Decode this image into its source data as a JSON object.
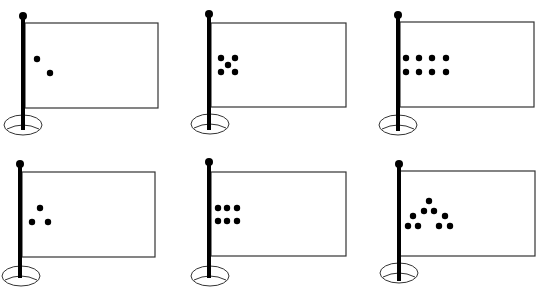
{
  "figure": {
    "colors": {
      "ink": "#000000",
      "outline": "#333333",
      "background": "#ffffff"
    },
    "flags": [
      {
        "id": "flag-1",
        "dot_count": 2,
        "pole": {
          "x": 23,
          "top": 16,
          "bottom": 130
        },
        "rect": {
          "x": 25,
          "y": 23,
          "w": 133,
          "h": 85
        },
        "base": {
          "cx": 23,
          "cy": 125,
          "rx": 19,
          "ry": 10
        },
        "dots": [
          [
            37,
            59
          ],
          [
            50,
            73
          ]
        ]
      },
      {
        "id": "flag-2",
        "dot_count": 5,
        "pole": {
          "x": 209,
          "top": 14,
          "bottom": 130
        },
        "rect": {
          "x": 211,
          "y": 23,
          "w": 135,
          "h": 84
        },
        "base": {
          "cx": 210,
          "cy": 124,
          "rx": 19,
          "ry": 10
        },
        "dots": [
          [
            221,
            58
          ],
          [
            235,
            58
          ],
          [
            228,
            65
          ],
          [
            221,
            72
          ],
          [
            235,
            72
          ]
        ]
      },
      {
        "id": "flag-3",
        "dot_count": 8,
        "pole": {
          "x": 398,
          "top": 15,
          "bottom": 131
        },
        "rect": {
          "x": 400,
          "y": 22,
          "w": 134,
          "h": 85
        },
        "base": {
          "cx": 398,
          "cy": 125,
          "rx": 19,
          "ry": 10
        },
        "dots": [
          [
            406,
            58
          ],
          [
            419,
            58
          ],
          [
            432,
            58
          ],
          [
            446,
            58
          ],
          [
            406,
            72
          ],
          [
            419,
            72
          ],
          [
            432,
            72
          ],
          [
            446,
            72
          ]
        ]
      },
      {
        "id": "flag-4",
        "dot_count": 3,
        "pole": {
          "x": 20,
          "top": 164,
          "bottom": 278
        },
        "rect": {
          "x": 22,
          "y": 172,
          "w": 133,
          "h": 85
        },
        "base": {
          "cx": 21,
          "cy": 276,
          "rx": 19,
          "ry": 10
        },
        "dots": [
          [
            40,
            208
          ],
          [
            32,
            222
          ],
          [
            48,
            222
          ]
        ]
      },
      {
        "id": "flag-5",
        "dot_count": 6,
        "pole": {
          "x": 209,
          "top": 162,
          "bottom": 278
        },
        "rect": {
          "x": 211,
          "y": 172,
          "w": 135,
          "h": 84
        },
        "base": {
          "cx": 210,
          "cy": 276,
          "rx": 19,
          "ry": 10
        },
        "dots": [
          [
            218,
            208
          ],
          [
            227,
            208
          ],
          [
            237,
            208
          ],
          [
            218,
            221
          ],
          [
            227,
            221
          ],
          [
            237,
            221
          ]
        ]
      },
      {
        "id": "flag-6",
        "dot_count": 9,
        "pole": {
          "x": 399,
          "top": 164,
          "bottom": 281
        },
        "rect": {
          "x": 400,
          "y": 171,
          "w": 135,
          "h": 85
        },
        "base": {
          "cx": 399,
          "cy": 273,
          "rx": 19,
          "ry": 10
        },
        "dots": [
          [
            429,
            201
          ],
          [
            424,
            211
          ],
          [
            434,
            211
          ],
          [
            413,
            216
          ],
          [
            445,
            216
          ],
          [
            408,
            226
          ],
          [
            418,
            226
          ],
          [
            439,
            226
          ],
          [
            450,
            226
          ]
        ]
      }
    ]
  }
}
